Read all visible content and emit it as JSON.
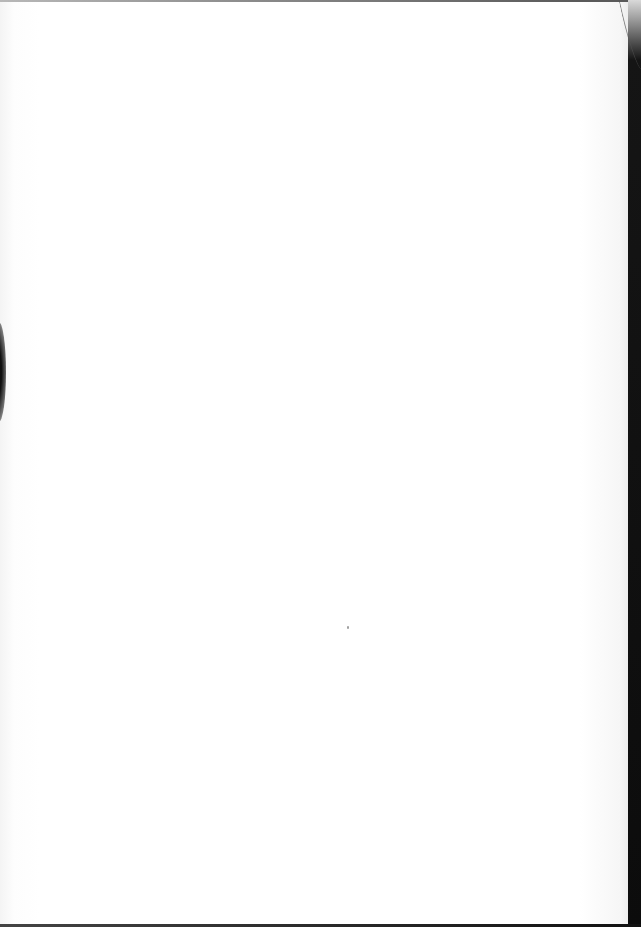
{
  "page": {
    "type": "scanned-page",
    "content": "",
    "background_color": "#ffffff",
    "border_color": "#0c0c0c"
  }
}
